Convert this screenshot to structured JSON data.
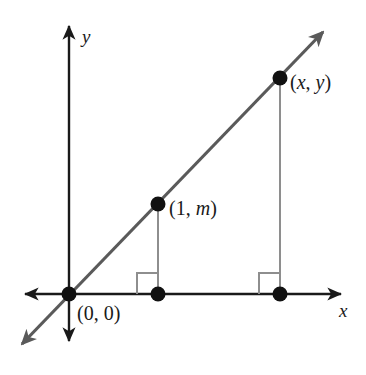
{
  "figure": {
    "kind": "coordinate-plane-diagram",
    "background_color": "#ffffff"
  },
  "axes": {
    "x_axis_label": "x",
    "y_axis_label": "y",
    "axis_color": "#1a1a1a",
    "origin_px": {
      "x": 69,
      "y": 294
    },
    "x_axis_left_arrow_px": {
      "x": 25,
      "y": 294
    },
    "x_axis_right_arrow_px": {
      "x": 341,
      "y": 294
    },
    "y_axis_top_arrow_px": {
      "x": 69,
      "y": 26
    },
    "y_axis_bottom_arrow_px": {
      "x": 69,
      "y": 341
    }
  },
  "line": {
    "description": "Straight line through the origin with positive slope m, double-headed arrow",
    "color": "#5a5a5a",
    "stroke_width": 3.2,
    "start_px": {
      "x": 22,
      "y": 344
    },
    "end_px": {
      "x": 323,
      "y": 32
    }
  },
  "points": [
    {
      "name": "origin",
      "label": "(0, 0)",
      "label_parts": [
        {
          "text": "(0, 0)",
          "italic": false
        }
      ],
      "px": {
        "x": 69,
        "y": 294
      },
      "radius": 7.5,
      "color": "#111111"
    },
    {
      "name": "unit-point",
      "label": "(1, m)",
      "label_parts": [
        {
          "text": "(1, ",
          "italic": false
        },
        {
          "text": "m",
          "italic": true
        },
        {
          "text": ")",
          "italic": false
        }
      ],
      "px": {
        "x": 158,
        "y": 204
      },
      "radius": 7.5,
      "color": "#111111"
    },
    {
      "name": "general-point",
      "label": "(x, y)",
      "label_parts": [
        {
          "text": "(",
          "italic": false
        },
        {
          "text": "x",
          "italic": true
        },
        {
          "text": ", ",
          "italic": false
        },
        {
          "text": "y",
          "italic": true
        },
        {
          "text": ")",
          "italic": false
        }
      ],
      "px": {
        "x": 280,
        "y": 78
      },
      "radius": 7.5,
      "color": "#111111"
    },
    {
      "name": "unit-point-foot",
      "label": "",
      "px": {
        "x": 158,
        "y": 294
      },
      "radius": 7.5,
      "color": "#111111"
    },
    {
      "name": "general-point-foot",
      "label": "",
      "px": {
        "x": 280,
        "y": 294
      },
      "radius": 7.5,
      "color": "#111111"
    }
  ],
  "drop_lines": [
    {
      "name": "unit-point-drop-line",
      "color": "#8e8e8e",
      "stroke_width": 2,
      "from_px": {
        "x": 158,
        "y": 204
      },
      "to_px": {
        "x": 158,
        "y": 294
      }
    },
    {
      "name": "general-point-drop-line",
      "color": "#8e8e8e",
      "stroke_width": 2,
      "from_px": {
        "x": 280,
        "y": 78
      },
      "to_px": {
        "x": 280,
        "y": 294
      }
    }
  ],
  "right_angle_marks": [
    {
      "name": "unit-point-right-angle",
      "color": "#8e8e8e",
      "stroke_width": 2,
      "size": 21,
      "corner_px": {
        "x": 158,
        "y": 294
      },
      "opens": "left-up"
    },
    {
      "name": "general-point-right-angle",
      "color": "#8e8e8e",
      "stroke_width": 2,
      "size": 21,
      "corner_px": {
        "x": 280,
        "y": 294
      },
      "opens": "left-up"
    }
  ],
  "labels": {
    "y_axis": "y",
    "x_axis": "x",
    "origin": "(0, 0)",
    "unit_point": "(1, m)",
    "general_point": "(x, y)"
  }
}
